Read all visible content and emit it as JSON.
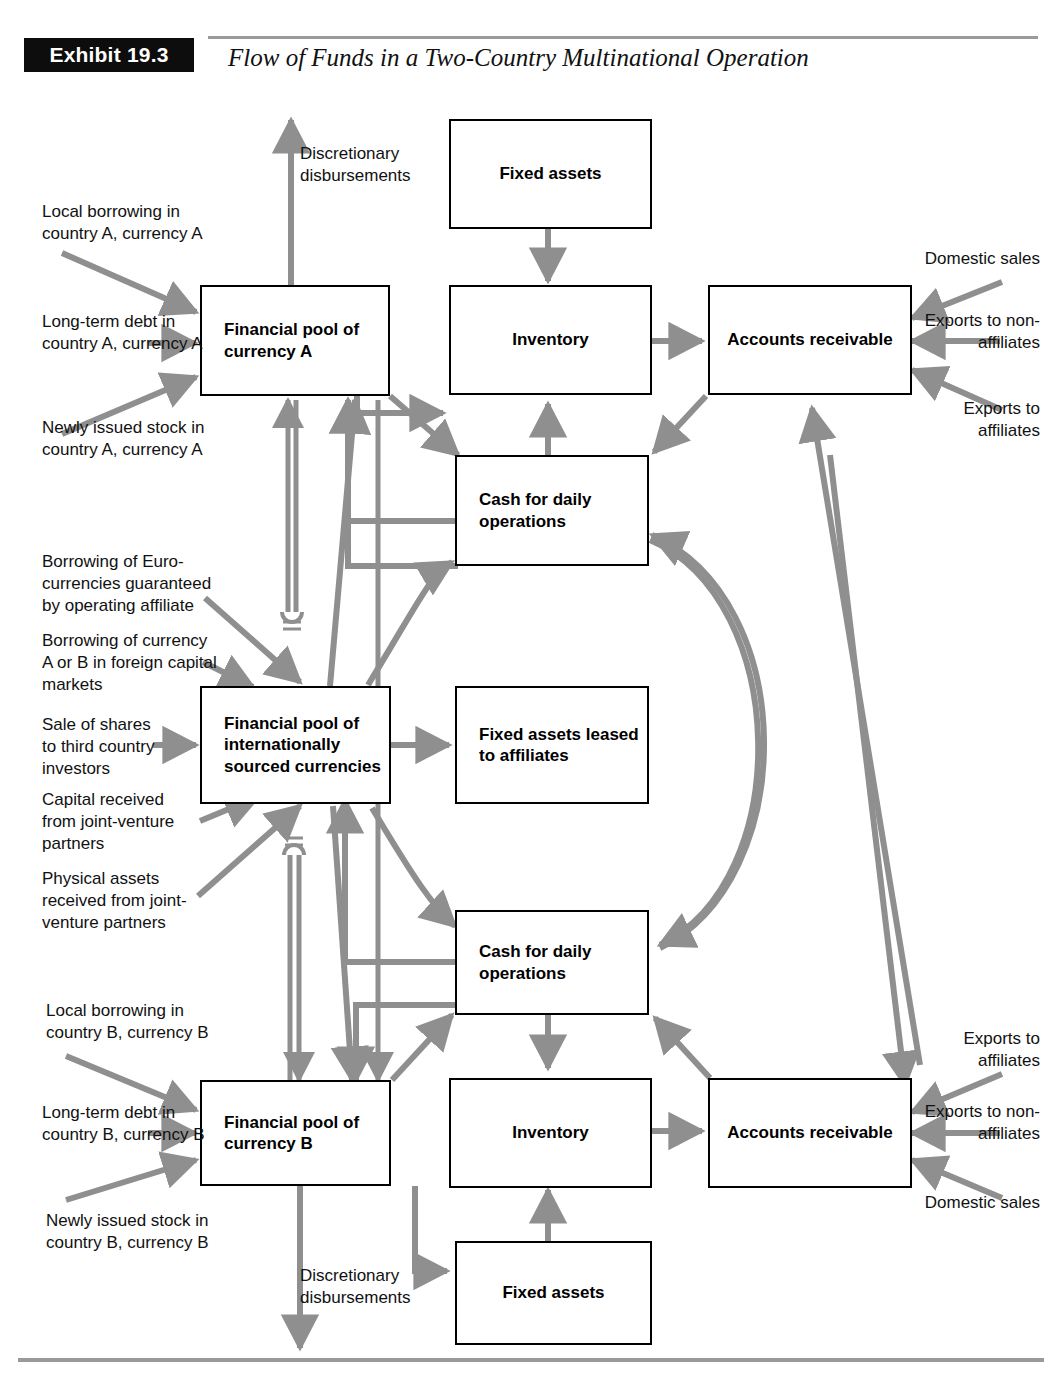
{
  "header": {
    "exhibit_tag": "Exhibit 19.3",
    "title": "Flow of Funds in a Two-Country Multinational Operation"
  },
  "nodes": {
    "pool_a": "Financial pool of currency A",
    "pool_intl": "Financial pool of internationally sourced currencies",
    "pool_b": "Financial pool of currency B",
    "fixed_assets_top": "Fixed assets",
    "inventory_top": "Inventory",
    "accounts_receivable_top": "Accounts receivable",
    "cash_top": "Cash for daily operations",
    "fixed_assets_leased": "Fixed assets leased to affiliates",
    "cash_bottom": "Cash for daily operations",
    "inventory_bottom": "Inventory",
    "accounts_receivable_bottom": "Accounts receivable",
    "fixed_assets_bottom": "Fixed assets"
  },
  "labels": {
    "discretionary_top": "Discretionary disbursements",
    "discretionary_bottom": "Discretionary disbursements",
    "local_borrowing_a": "Local borrowing in country A, currency A",
    "long_term_debt_a": "Long-term debt in country A, currency A",
    "newly_issued_stock_a": "Newly issued stock in country A, currency A",
    "euro_borrowing": "Borrowing of Euro-currencies guaranteed by operating affiliate",
    "foreign_capital_markets": "Borrowing of currency A or B in foreign capital markets",
    "sale_of_shares": "Sale of shares to third country investors",
    "capital_jv": "Capital received from joint-venture partners",
    "physical_assets_jv": "Physical assets received from joint-venture partners",
    "local_borrowing_b": "Local borrowing in country B, currency B",
    "long_term_debt_b": "Long-term debt in country B, currency B",
    "newly_issued_stock_b": "Newly issued stock in country B, currency B",
    "domestic_sales_top": "Domestic sales",
    "exports_nonaffiliates_top": "Exports to non-affiliates",
    "exports_affiliates_top": "Exports to affiliates",
    "exports_affiliates_bottom": "Exports to affiliates",
    "exports_nonaffiliates_bottom": "Exports to non-affiliates",
    "domestic_sales_bottom": "Domestic sales"
  },
  "colors": {
    "arrow": "#8f8f8f",
    "box_border": "#000000",
    "tag_background": "#0d0d0d",
    "rule": "#9a9a9a"
  }
}
